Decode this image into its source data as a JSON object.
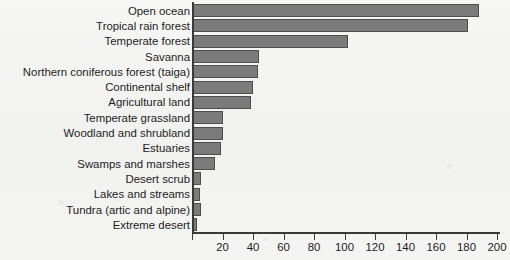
{
  "chart_data": {
    "type": "bar",
    "orientation": "horizontal",
    "title": "",
    "xlabel": "",
    "ylabel": "",
    "xlim": [
      0,
      200
    ],
    "xticks": [
      0,
      20,
      40,
      60,
      80,
      100,
      120,
      140,
      160,
      180,
      200
    ],
    "xtick_labels": [
      "",
      "20",
      "40",
      "60",
      "80",
      "100",
      "120",
      "140",
      "160",
      "180",
      "200"
    ],
    "grid": false,
    "legend": null,
    "bar_color": "#7b7b7b",
    "bar_edge_color": "#4d4d4d",
    "background_color": "#f3f3f1",
    "categories": [
      "Open ocean",
      "Tropical rain forest",
      "Temperate forest",
      "Savanna",
      "Northern coniferous forest (taiga)",
      "Continental shelf",
      "Agricultural land",
      "Temperate grassland",
      "Woodland and shrubland",
      "Estuaries",
      "Swamps and marshes",
      "Desert scrub",
      "Lakes and streams",
      "Tundra (artic and alpine)",
      "Extreme desert"
    ],
    "values": [
      188,
      181,
      102,
      44,
      43,
      40,
      39,
      20,
      20,
      19,
      15,
      6,
      5,
      6,
      3
    ]
  }
}
